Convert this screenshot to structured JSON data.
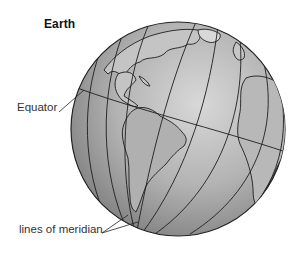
{
  "diagram": {
    "title": "Earth",
    "labels": {
      "equator": "Equator",
      "meridians": "lines of meridian"
    },
    "globe": {
      "center": [
        178,
        129
      ],
      "radius": 107,
      "fill_light": "#d6d6d6",
      "fill_dark": "#8a8a8a",
      "line_color": "#1e1e1e"
    }
  }
}
